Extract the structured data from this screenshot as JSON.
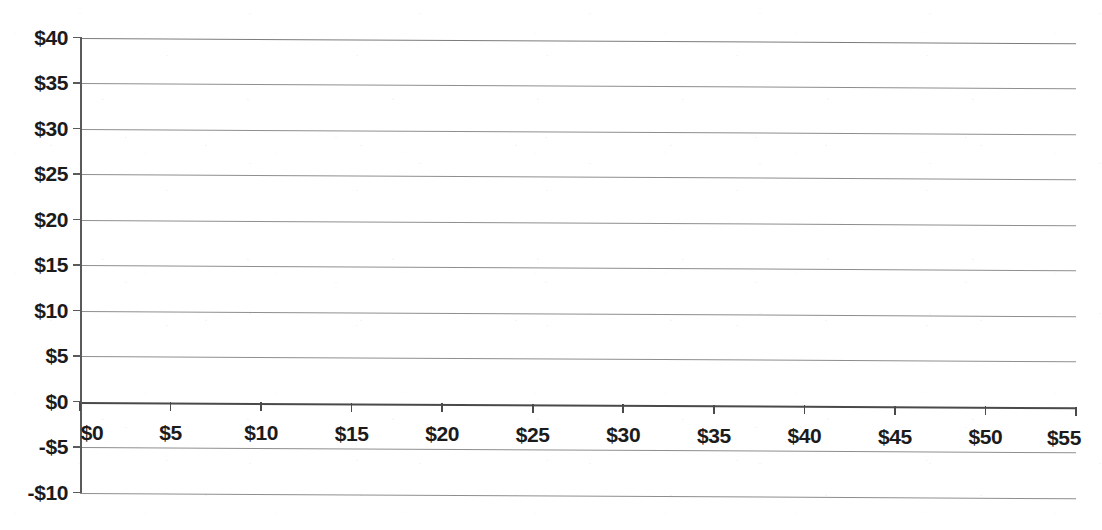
{
  "chart_data": {
    "type": "line",
    "title": "",
    "subtitle": "",
    "xlabel": "",
    "ylabel": "",
    "series": [],
    "x": [
      0,
      5,
      10,
      15,
      20,
      25,
      30,
      35,
      40,
      45,
      50,
      55
    ],
    "xtick_labels": [
      "$0",
      "$5",
      "$10",
      "$15",
      "$20",
      "$25",
      "$30",
      "$35",
      "$40",
      "$45",
      "$50",
      "$55"
    ],
    "ytick_values": [
      40,
      35,
      30,
      25,
      20,
      15,
      10,
      5,
      0,
      -5,
      -10
    ],
    "ytick_labels": [
      "$40",
      "$35",
      "$30",
      "$25",
      "$20",
      "$15",
      "$10",
      "$5",
      "$0",
      "-$5",
      "-$10"
    ],
    "xlim": [
      0,
      55
    ],
    "ylim": [
      -10,
      40
    ],
    "grid": true,
    "grid_axis": "y",
    "legend": false,
    "legend_position": "none",
    "annotations": [],
    "zero_line_value": 0
  },
  "style": {
    "background_color": "#ffffff",
    "gridline_color": "#8e8e8e",
    "axis_color": "#4a4a4a",
    "text_color": "#1b1b1b"
  }
}
